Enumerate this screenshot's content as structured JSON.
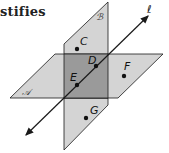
{
  "heading": "stifies",
  "colors": {
    "plane_fill": "#d4d4d4",
    "overlap_fill": "#9a9a9a",
    "stroke": "#1a1a1a"
  },
  "diagram": {
    "planes": [
      {
        "name": "A",
        "label": "𝒜"
      },
      {
        "name": "B",
        "label": "ℬ"
      }
    ],
    "line": {
      "name": "l",
      "label": "ℓ"
    },
    "points": [
      {
        "name": "C",
        "label": "C",
        "on": "plane B"
      },
      {
        "name": "D",
        "label": "D",
        "on": "line l"
      },
      {
        "name": "E",
        "label": "E",
        "on": "line l"
      },
      {
        "name": "F",
        "label": "F",
        "on": "plane A"
      },
      {
        "name": "G",
        "label": "G",
        "on": "plane B"
      }
    ]
  }
}
